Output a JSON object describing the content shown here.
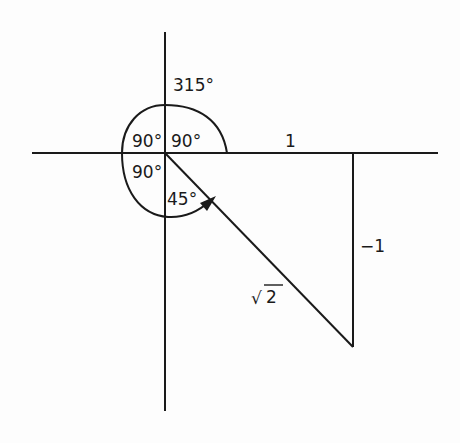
{
  "diagram": {
    "stroke_color": "#1a1a1a",
    "background": "#fdfdfd",
    "labels": {
      "angle_total": "315°",
      "angle_q1": "90°",
      "angle_q2": "90°",
      "angle_q3": "90°",
      "angle_q4": "45°",
      "adjacent": "1",
      "opposite": "−1",
      "hypotenuse_radical": "√",
      "hypotenuse_value": "2"
    }
  }
}
